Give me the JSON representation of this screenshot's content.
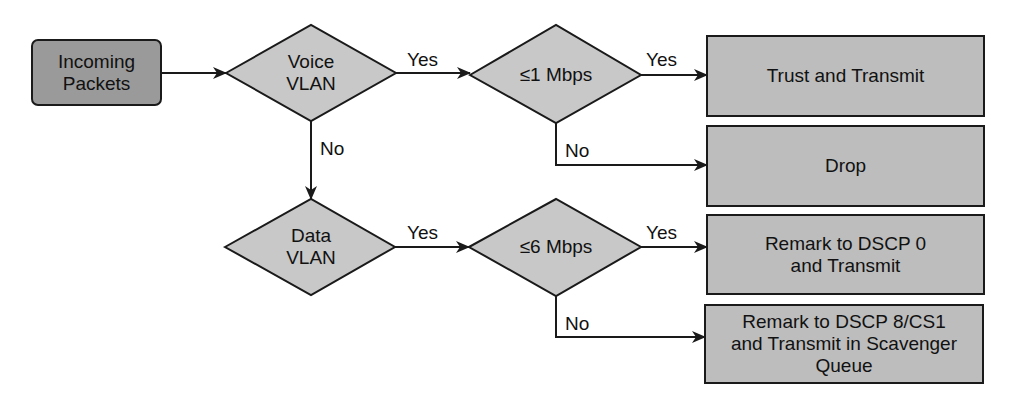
{
  "diagram": {
    "type": "flowchart",
    "colors": {
      "start_fill": "#9a9a9a",
      "decision_fill": "#c8c8c8",
      "action_fill": "#bdbdbd",
      "stroke": "#1a1a1a",
      "background": "#ffffff"
    },
    "nodes": {
      "incoming": {
        "line1": "Incoming",
        "line2": "Packets"
      },
      "voice_vlan": {
        "line1": "Voice",
        "line2": "VLAN"
      },
      "voice_rate": {
        "label": "≤1 Mbps"
      },
      "data_vlan": {
        "line1": "Data",
        "line2": "VLAN"
      },
      "data_rate": {
        "label": "≤6 Mbps"
      },
      "trust": {
        "label": "Trust and Transmit"
      },
      "drop": {
        "label": "Drop"
      },
      "remark0": {
        "line1": "Remark to DSCP 0",
        "line2": "and Transmit"
      },
      "remark8": {
        "line1": "Remark to DSCP 8/CS1",
        "line2": "and Transmit in Scavenger",
        "line3": "Queue"
      }
    },
    "edges": {
      "voice_yes": "Yes",
      "voice_no": "No",
      "voice_rate_yes": "Yes",
      "voice_rate_no": "No",
      "data_yes": "Yes",
      "data_rate_yes": "Yes",
      "data_rate_no": "No"
    }
  }
}
